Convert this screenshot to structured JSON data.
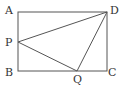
{
  "figure": {
    "type": "geometry-rectangle-with-triangle",
    "stroke_color": "#555555",
    "label_color": "#333333",
    "points": {
      "A": {
        "label": "A",
        "x": 18,
        "y": 12
      },
      "B": {
        "label": "B",
        "x": 18,
        "y": 71
      },
      "C": {
        "label": "C",
        "x": 107,
        "y": 71
      },
      "D": {
        "label": "D",
        "x": 107,
        "y": 12
      },
      "P": {
        "label": "P",
        "x": 18,
        "y": 42
      },
      "Q": {
        "label": "Q",
        "x": 77,
        "y": 71
      }
    },
    "segments": [
      "AB",
      "BC",
      "CD",
      "DA",
      "PD",
      "PQ",
      "QD"
    ]
  }
}
